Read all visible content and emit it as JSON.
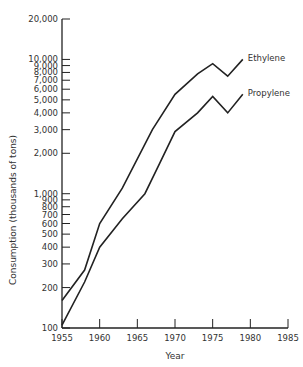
{
  "chart_data": {
    "type": "line",
    "title": "",
    "xlabel": "Year",
    "ylabel": "Consumption (thousands of tons)",
    "yscale": "log",
    "xlim": [
      1955,
      1985
    ],
    "ylim": [
      100,
      20000
    ],
    "grid": false,
    "x_ticks": [
      1955,
      1960,
      1965,
      1970,
      1975,
      1980,
      1985
    ],
    "x_tick_labels": [
      "1955",
      "1960",
      "1965",
      "1970",
      "1975",
      "1980",
      "1985"
    ],
    "y_ticks": [
      100,
      200,
      300,
      400,
      500,
      600,
      700,
      800,
      900,
      1000,
      2000,
      3000,
      4000,
      5000,
      6000,
      7000,
      8000,
      9000,
      10000,
      20000
    ],
    "y_tick_labels": [
      "100",
      "200",
      "300",
      "400",
      "500",
      "600",
      "700",
      "800",
      "900",
      "1,000",
      "2,000",
      "3,000",
      "4,000",
      "5,000",
      "6,000",
      "7,000",
      "8,000",
      "9,000",
      "10,000",
      "20,000"
    ],
    "series": [
      {
        "name": "Ethylene",
        "x": [
          1955,
          1958,
          1960,
          1963,
          1967,
          1970,
          1973,
          1975,
          1977,
          1979
        ],
        "values": [
          160,
          270,
          600,
          1100,
          3000,
          5500,
          7800,
          9300,
          7500,
          10000
        ]
      },
      {
        "name": "Propylene",
        "x": [
          1955,
          1958,
          1960,
          1963,
          1966,
          1968,
          1970,
          1973,
          1975,
          1977,
          1979
        ],
        "values": [
          105,
          220,
          400,
          650,
          1000,
          1700,
          2900,
          4000,
          5300,
          4000,
          5500
        ]
      }
    ],
    "legend_position": "direct-labels-at-line-ends",
    "line_color": "#222222"
  }
}
